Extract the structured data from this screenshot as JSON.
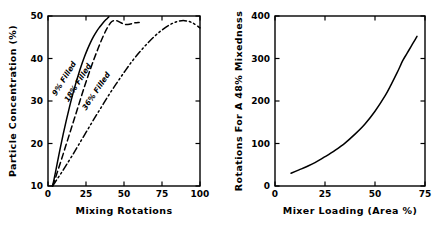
{
  "figure": {
    "name": "two-panel-mixing-figure",
    "background": "#ffffff",
    "ink_color": "#000000"
  },
  "chart_data": [
    {
      "id": "left",
      "type": "line",
      "title": "",
      "xlabel": "Mixing Rotations",
      "ylabel": "Particle Concentration (%)",
      "xlim": [
        0,
        100
      ],
      "ylim": [
        10,
        50
      ],
      "xticks": [
        0,
        25,
        50,
        75,
        100
      ],
      "yticks": [
        10,
        20,
        30,
        40,
        50
      ],
      "xticklabels": [
        "0",
        "25",
        "50",
        "75",
        "100"
      ],
      "yticklabels": [
        "10",
        "20",
        "30",
        "40",
        "50"
      ],
      "grid": false,
      "legend": "inline-curve-labels",
      "frame": "box",
      "tick_direction": "in",
      "series": [
        {
          "name": "9% Filled",
          "label": "9% Filled",
          "linestyle": "solid",
          "dasharray": "",
          "label_x": 12,
          "label_y": 35,
          "label_rotation": -58,
          "x": [
            3,
            4,
            5,
            6,
            8,
            10,
            12,
            14,
            16,
            18,
            20,
            22,
            24,
            26,
            28,
            30,
            32,
            34,
            36,
            38,
            40
          ],
          "y": [
            10,
            11.6,
            13.4,
            15.2,
            18.8,
            22.2,
            25.4,
            28.4,
            31.2,
            33.8,
            36.2,
            38.4,
            40.4,
            42.2,
            43.8,
            45.2,
            46.4,
            47.4,
            48.3,
            49.1,
            49.8
          ]
        },
        {
          "name": "18% Filled",
          "label": "18% Filled",
          "linestyle": "dashed",
          "dasharray": "6,3.5",
          "label_x": 21,
          "label_y": 34,
          "label_rotation": -58,
          "x": [
            3,
            5,
            7,
            9,
            12,
            15,
            18,
            21,
            24,
            27,
            30,
            33,
            36,
            39,
            42,
            45,
            48,
            51,
            54,
            57,
            60
          ],
          "y": [
            10,
            12.0,
            14.2,
            16.4,
            19.8,
            23.2,
            26.6,
            30.0,
            33.4,
            36.6,
            39.6,
            42.4,
            45.0,
            47.2,
            48.7,
            48.9,
            48.4,
            48.0,
            48.1,
            48.4,
            48.5
          ]
        },
        {
          "name": "36% Filled",
          "label": "36% Filled",
          "linestyle": "dash-dot-dot",
          "dasharray": "7,3,1.6,3,1.6,3",
          "label_x": 33,
          "label_y": 32,
          "label_rotation": -56,
          "x": [
            3,
            6,
            9,
            12,
            16,
            20,
            25,
            30,
            35,
            40,
            45,
            50,
            55,
            60,
            65,
            70,
            75,
            80,
            85,
            90,
            95,
            100
          ],
          "y": [
            10,
            11.6,
            13.2,
            14.9,
            17.2,
            19.6,
            22.6,
            25.6,
            28.5,
            31.4,
            34.1,
            36.7,
            39.2,
            41.4,
            43.4,
            45.2,
            46.7,
            47.9,
            48.7,
            48.9,
            48.4,
            47.2
          ]
        }
      ]
    },
    {
      "id": "right",
      "type": "line",
      "title": "",
      "xlabel": "Mixer Loading (Area %)",
      "ylabel": "Rotations For A 48% Mixedness",
      "xlim": [
        0,
        75
      ],
      "ylim": [
        0,
        400
      ],
      "xticks": [
        0,
        25,
        50,
        75
      ],
      "yticks": [
        0,
        100,
        200,
        300,
        400
      ],
      "xticklabels": [
        "0",
        "25",
        "50",
        "75"
      ],
      "yticklabels": [
        "0",
        "100",
        "200",
        "300",
        "400"
      ],
      "grid": false,
      "legend": "none",
      "frame": "box",
      "tick_direction": "in",
      "series": [
        {
          "name": "rotations-curve",
          "label": "",
          "linestyle": "solid",
          "dasharray": "",
          "x": [
            8,
            12,
            16,
            20,
            25,
            30,
            35,
            40,
            45,
            50,
            55,
            58,
            61,
            64,
            66,
            68,
            70,
            71
          ],
          "y": [
            30,
            38,
            46,
            55,
            69,
            84,
            101,
            122,
            146,
            176,
            212,
            238,
            266,
            296,
            312,
            328,
            344,
            352
          ]
        }
      ]
    }
  ]
}
